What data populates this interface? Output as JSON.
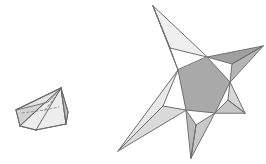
{
  "figure": {
    "title": "Two shaded polyhedra line drawings",
    "canvas": {
      "width": 266,
      "height": 164,
      "background": "#ffffff"
    },
    "palette": {
      "outline": "#6f6f6f",
      "outline_dark": "#5a5a5a",
      "hidden_edge": "#8d8d8d",
      "face_lightest": "#f3f3f3",
      "face_light": "#e8e8e8",
      "face_mid_light": "#dcdcdc",
      "face_mid": "#cfcfcf",
      "face_mid_dark": "#bdbdbd",
      "face_dark": "#ababab",
      "face_darkest": "#9c9c9c"
    },
    "shapes": [
      {
        "id": "left-solid",
        "name": "oblique-pentagonal-pyramid",
        "label": "Left solid: low oblique pyramid with dashed hidden edges",
        "apex": [
          61,
          88
        ],
        "faces": [
          {
            "name": "left-front-face",
            "points": "16,110 20,126 36,130 61,88",
            "fill": "#d2d2d2",
            "stroke": "#6f6f6f",
            "stroke_width": 0.9
          },
          {
            "name": "bottom-front-face",
            "points": "20,126 36,130 66,124 61,88",
            "fill": "#ededed",
            "stroke": "#6f6f6f",
            "stroke_width": 0.9
          },
          {
            "name": "right-front-face",
            "points": "61,88 66,124 68,112",
            "fill": "#bdbdbd",
            "stroke": "#6f6f6f",
            "stroke_width": 0.9
          },
          {
            "name": "top-left-face",
            "points": "16,110 61,88 48,102",
            "fill": "#e3e3e3",
            "stroke": "#6f6f6f",
            "stroke_width": 0.9
          }
        ],
        "hidden_edges": [
          {
            "name": "hidden-edge-base-a",
            "d": "M 22,113 L 45,110",
            "stroke": "#8d8d8d",
            "dash": "2.4 2.2",
            "stroke_width": 0.85
          },
          {
            "name": "hidden-edge-base-b",
            "d": "M 45,110 L 53,101",
            "stroke": "#8d8d8d",
            "dash": "2.4 2.2",
            "stroke_width": 0.85
          },
          {
            "name": "hidden-edge-base-c",
            "d": "M 45,110 L 59,107",
            "stroke": "#8d8d8d",
            "dash": "2.4 2.2",
            "stroke_width": 0.85
          },
          {
            "name": "hidden-edge-apex",
            "d": "M 45,110 L 61,89",
            "stroke": "#8d8d8d",
            "dash": "2.4 2.2",
            "stroke_width": 0.85
          }
        ],
        "visible_edges": [
          {
            "name": "edge-apex-to-left",
            "d": "M 61,88 L 16,110",
            "stroke": "#6a6a6a",
            "stroke_width": 1.0
          },
          {
            "name": "edge-apex-to-bottom-left",
            "d": "M 61,88 L 20,126",
            "stroke": "#6a6a6a",
            "stroke_width": 1.0
          },
          {
            "name": "edge-apex-to-bottom-mid",
            "d": "M 61,88 L 36,130",
            "stroke": "#6a6a6a",
            "stroke_width": 1.0
          },
          {
            "name": "edge-apex-to-right",
            "d": "M 61,88 L 66,124",
            "stroke": "#6a6a6a",
            "stroke_width": 1.0
          },
          {
            "name": "edge-apex-to-right-upper",
            "d": "M 61,88 L 68,112",
            "stroke": "#6a6a6a",
            "stroke_width": 1.0
          },
          {
            "name": "edge-left-rim",
            "d": "M 16,110 L 20,126",
            "stroke": "#6a6a6a",
            "stroke_width": 1.0
          },
          {
            "name": "edge-bottom-rim",
            "d": "M 20,126 L 36,130",
            "stroke": "#6a6a6a",
            "stroke_width": 1.0
          },
          {
            "name": "edge-bottom-right-rim",
            "d": "M 36,130 L 66,124",
            "stroke": "#6a6a6a",
            "stroke_width": 1.0
          },
          {
            "name": "edge-right-rim",
            "d": "M 66,124 L 68,112",
            "stroke": "#6a6a6a",
            "stroke_width": 1.0
          }
        ]
      },
      {
        "id": "right-solid",
        "name": "five-pointed-star-polyhedron",
        "label": "Right solid: five-pointed pentagrammic star with central pentagon",
        "central_pentagon": {
          "name": "central-pentagon-face",
          "points": "178,70 186,110 215,113 230,82 207,57",
          "fill": "#a9a9a9",
          "stroke": "#6f6f6f",
          "stroke_width": 1.0
        },
        "points_count": 5,
        "spikes": [
          {
            "name": "spike-top",
            "tip": [
              153,
              6
            ],
            "faces": [
              {
                "name": "spike-top-left-face",
                "points": "153,6 178,70 170,48",
                "fill": "#e4e4e4",
                "stroke": "#6f6f6f",
                "stroke_width": 1.0
              },
              {
                "name": "spike-top-right-face",
                "points": "153,6 170,48 207,57",
                "fill": "#efefef",
                "stroke": "#6f6f6f",
                "stroke_width": 1.0
              }
            ]
          },
          {
            "name": "spike-right-upper",
            "tip": [
              263,
              46
            ],
            "faces": [
              {
                "name": "spike-right-upper-top-face",
                "points": "263,46 207,57 232,64",
                "fill": "#a0a0a0",
                "stroke": "#6f6f6f",
                "stroke_width": 1.0
              },
              {
                "name": "spike-right-upper-bottom-face",
                "points": "263,46 232,64 230,82",
                "fill": "#b5b5b5",
                "stroke": "#6f6f6f",
                "stroke_width": 1.0
              }
            ]
          },
          {
            "name": "spike-right-lower",
            "tip": [
              245,
              113
            ],
            "faces": [
              {
                "name": "spike-right-lower-top-face",
                "points": "245,113 230,82 228,100",
                "fill": "#d8d8d8",
                "stroke": "#6f6f6f",
                "stroke_width": 1.0
              },
              {
                "name": "spike-right-lower-bottom-face",
                "points": "245,113 228,100 215,113",
                "fill": "#c6c6c6",
                "stroke": "#6f6f6f",
                "stroke_width": 1.0
              }
            ]
          },
          {
            "name": "spike-bottom",
            "tip": [
              191,
              158
            ],
            "faces": [
              {
                "name": "spike-bottom-left-face",
                "points": "191,158 215,113 196,125",
                "fill": "#c9c9c9",
                "stroke": "#6f6f6f",
                "stroke_width": 1.0
              },
              {
                "name": "spike-bottom-right-face",
                "points": "191,158 196,125 186,110",
                "fill": "#bababa",
                "stroke": "#6f6f6f",
                "stroke_width": 1.0
              }
            ]
          },
          {
            "name": "spike-left-lower",
            "tip": [
              118,
              151
            ],
            "faces": [
              {
                "name": "spike-left-lower-top-face",
                "points": "118,151 178,70 163,106",
                "fill": "#e9e9e9",
                "stroke": "#6f6f6f",
                "stroke_width": 1.0
              },
              {
                "name": "spike-left-lower-bottom-face",
                "points": "118,151 163,106 186,110",
                "fill": "#dadada",
                "stroke": "#6f6f6f",
                "stroke_width": 1.0
              }
            ]
          }
        ],
        "ridge_edges": [
          {
            "name": "ridge-top-spike",
            "d": "M 153,6 L 170,48",
            "stroke": "#6f6f6f",
            "stroke_width": 1.0
          },
          {
            "name": "ridge-right-upper-spike",
            "d": "M 263,46 L 232,64",
            "stroke": "#6f6f6f",
            "stroke_width": 1.0
          },
          {
            "name": "ridge-right-lower-spike",
            "d": "M 245,113 L 228,100",
            "stroke": "#6f6f6f",
            "stroke_width": 1.0
          },
          {
            "name": "ridge-bottom-spike",
            "d": "M 191,158 L 196,125",
            "stroke": "#6f6f6f",
            "stroke_width": 1.0
          },
          {
            "name": "ridge-left-lower-spike",
            "d": "M 118,151 L 163,106",
            "stroke": "#6f6f6f",
            "stroke_width": 1.0
          }
        ]
      }
    ]
  }
}
